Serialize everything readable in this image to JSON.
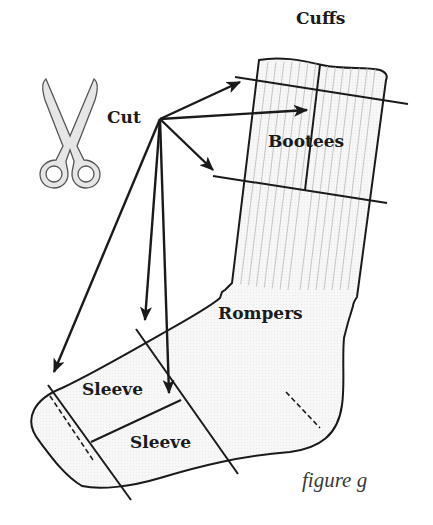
{
  "figure": {
    "caption": "figure g"
  },
  "labels": {
    "cut": "Cut",
    "cuffs": "Cuffs",
    "bootees": "Bootees",
    "rompers": "Rompers",
    "sleeve_upper": "Sleeve",
    "sleeve_lower": "Sleeve"
  },
  "icons": {
    "scissors": "scissors-icon"
  },
  "colors": {
    "ink": "#1a1a1a",
    "sock_fill": "#f4f4f4",
    "rib_lines": "#b8b8b8",
    "scissors_fill": "#e6e6e6",
    "scissors_outline": "#555555",
    "caption": "#3a3a3a"
  },
  "arrows": [
    {
      "from": "cut",
      "to": "cuff-line-top"
    },
    {
      "from": "cut",
      "to": "center-vertical-cut"
    },
    {
      "from": "cut",
      "to": "cuff-line-bottom"
    },
    {
      "from": "cut",
      "to": "toe-cut-line"
    },
    {
      "from": "cut",
      "to": "sleeve-cut-line-left"
    },
    {
      "from": "cut",
      "to": "sleeve-cut-line-right"
    }
  ]
}
